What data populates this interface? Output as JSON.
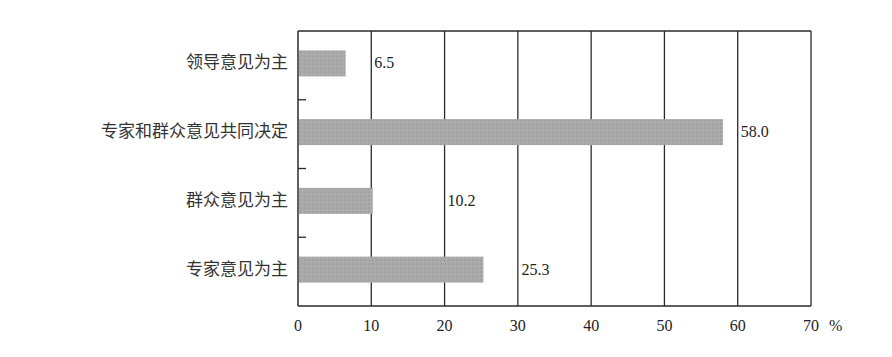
{
  "chart_data": {
    "type": "bar",
    "orientation": "horizontal",
    "title": "",
    "xlabel": "",
    "ylabel": "",
    "unit": "%",
    "categories": [
      "领导意见为主",
      "专家和群众意见共同决定",
      "群众意见为主",
      "专家意见为主"
    ],
    "values": [
      6.5,
      58.0,
      10.2,
      25.3
    ],
    "value_labels": [
      "6.5",
      "58.0",
      "10.2",
      "25.3"
    ],
    "xlim": [
      0,
      70
    ],
    "x_ticks": [
      "0",
      "10",
      "20",
      "30",
      "40",
      "50",
      "60",
      "70"
    ],
    "grid": true,
    "legend": null,
    "bar_color": "#a9a9a9"
  }
}
